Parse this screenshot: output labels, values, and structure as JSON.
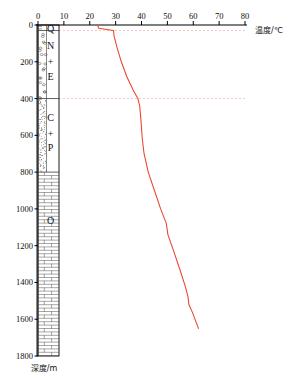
{
  "chart_data": {
    "type": "line",
    "title": "",
    "xlabel": "温度/℃",
    "ylabel": "深度/m",
    "xlabel_text": "温度",
    "xlabel_unit": "/℃",
    "ylabel_text": "深度",
    "ylabel_unit": "/m",
    "xlim": [
      0,
      80
    ],
    "ylim": [
      0,
      1800
    ],
    "x_ticks": [
      0,
      10,
      20,
      30,
      40,
      50,
      60,
      70,
      80
    ],
    "y_ticks": [
      0,
      200,
      400,
      600,
      800,
      1000,
      1200,
      1400,
      1600,
      1800
    ],
    "x_axis_position": "top",
    "y_axis_direction": "down",
    "grid": "dashed-horizontal",
    "gridlines_depth": [
      30,
      400
    ],
    "legend": "none",
    "series": [
      {
        "name": "井温曲线",
        "color": "#e8432c",
        "points": [
          {
            "depth": 0,
            "temp": 23.0
          },
          {
            "depth": 18,
            "temp": 23.5
          },
          {
            "depth": 30,
            "temp": 29.2
          },
          {
            "depth": 60,
            "temp": 29.4
          },
          {
            "depth": 120,
            "temp": 30.5
          },
          {
            "depth": 200,
            "temp": 32.2
          },
          {
            "depth": 280,
            "temp": 34.3
          },
          {
            "depth": 360,
            "temp": 37.0
          },
          {
            "depth": 400,
            "temp": 38.6
          },
          {
            "depth": 440,
            "temp": 39.3
          },
          {
            "depth": 520,
            "temp": 39.8
          },
          {
            "depth": 620,
            "temp": 40.3
          },
          {
            "depth": 700,
            "temp": 41.0
          },
          {
            "depth": 800,
            "temp": 42.6
          },
          {
            "depth": 900,
            "temp": 45.0
          },
          {
            "depth": 1000,
            "temp": 47.4
          },
          {
            "depth": 1080,
            "temp": 49.6
          },
          {
            "depth": 1140,
            "temp": 50.2
          },
          {
            "depth": 1220,
            "temp": 52.2
          },
          {
            "depth": 1320,
            "temp": 54.6
          },
          {
            "depth": 1420,
            "temp": 56.9
          },
          {
            "depth": 1480,
            "temp": 58.0
          },
          {
            "depth": 1520,
            "temp": 58.3
          },
          {
            "depth": 1560,
            "temp": 59.6
          },
          {
            "depth": 1650,
            "temp": 62.0
          }
        ]
      }
    ]
  },
  "lithology": {
    "column_label": "地层柱状图",
    "units": [
      {
        "code": "Q",
        "top": 0,
        "bottom": 30,
        "pattern": "soil"
      },
      {
        "code": "N",
        "top": 30,
        "bottom": 400,
        "pattern": "conglomerate"
      },
      {
        "code": "+",
        "top": 30,
        "bottom": 400,
        "pattern": "conglomerate"
      },
      {
        "code": "E",
        "top": 30,
        "bottom": 400,
        "pattern": "conglomerate"
      },
      {
        "code": "C",
        "top": 400,
        "bottom": 800,
        "pattern": "sandstone"
      },
      {
        "code": "+",
        "top": 400,
        "bottom": 800,
        "pattern": "sandstone"
      },
      {
        "code": "P",
        "top": 400,
        "bottom": 800,
        "pattern": "sandstone"
      },
      {
        "code": "O",
        "top": 800,
        "bottom": 1800,
        "pattern": "limestone"
      }
    ],
    "unit_labels": [
      {
        "code": "Q",
        "depth": 15
      },
      {
        "code": "N",
        "depth": 110
      },
      {
        "code": "+",
        "depth": 195
      },
      {
        "code": "E",
        "depth": 275
      },
      {
        "code": "C",
        "depth": 500
      },
      {
        "code": "+",
        "depth": 585
      },
      {
        "code": "P",
        "depth": 665
      },
      {
        "code": "O",
        "depth": 1060
      }
    ]
  },
  "colors": {
    "curve": "#e8432c",
    "axis": "#000000",
    "grid": "#f0b3aa",
    "pattern": "#3a3a3a"
  }
}
